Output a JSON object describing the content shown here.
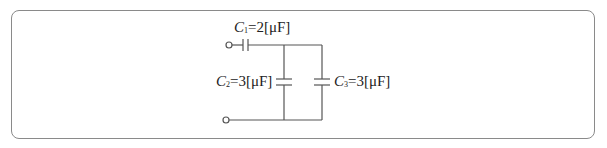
{
  "diagram": {
    "type": "capacitor-circuit",
    "capacitors": [
      {
        "id": "C1",
        "symbol": "C",
        "subscript": "1",
        "value": "=2[μF]",
        "position": "series-top"
      },
      {
        "id": "C2",
        "symbol": "C",
        "subscript": "2",
        "value": "=3[μF]",
        "position": "parallel-left"
      },
      {
        "id": "C3",
        "symbol": "C",
        "subscript": "3",
        "value": "=3[μF]",
        "position": "parallel-right"
      }
    ],
    "terminals": [
      "top-left",
      "bottom-left"
    ],
    "colors": {
      "wire": "#555555",
      "frame": "#8a8a8a",
      "text": "#222222"
    }
  }
}
